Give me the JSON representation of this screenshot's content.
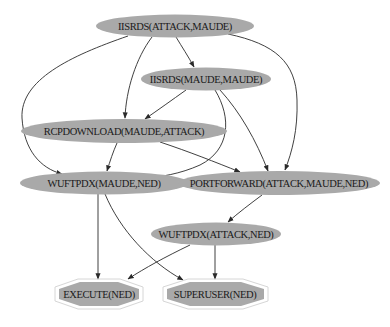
{
  "diagram": {
    "type": "attack-graph",
    "nodes": [
      {
        "id": "n1",
        "label": "IISRDS(ATTACK,MAUDE)",
        "shape": "ellipse"
      },
      {
        "id": "n2",
        "label": "IISRDS(MAUDE,MAUDE)",
        "shape": "ellipse"
      },
      {
        "id": "n3",
        "label": "RCPDOWNLOAD(MAUDE,ATTACK)",
        "shape": "ellipse"
      },
      {
        "id": "n4",
        "label": "WUFTPDX(MAUDE,NED)",
        "shape": "ellipse"
      },
      {
        "id": "n5",
        "label": "PORTFORWARD(ATTACK,MAUDE,NED)",
        "shape": "ellipse"
      },
      {
        "id": "n6",
        "label": "WUFTPDX(ATTACK,NED)",
        "shape": "ellipse"
      },
      {
        "id": "n7",
        "label": "EXECUTE(NED)",
        "shape": "double-octagon"
      },
      {
        "id": "n8",
        "label": "SUPERUSER(NED)",
        "shape": "double-octagon"
      }
    ],
    "edges": [
      {
        "from": "n1",
        "to": "n2"
      },
      {
        "from": "n1",
        "to": "n3"
      },
      {
        "from": "n1",
        "to": "n4"
      },
      {
        "from": "n1",
        "to": "n5"
      },
      {
        "from": "n2",
        "to": "n3"
      },
      {
        "from": "n2",
        "to": "n4"
      },
      {
        "from": "n2",
        "to": "n5"
      },
      {
        "from": "n3",
        "to": "n4"
      },
      {
        "from": "n3",
        "to": "n5"
      },
      {
        "from": "n4",
        "to": "n7"
      },
      {
        "from": "n4",
        "to": "n8"
      },
      {
        "from": "n5",
        "to": "n6"
      },
      {
        "from": "n6",
        "to": "n7"
      },
      {
        "from": "n6",
        "to": "n8"
      }
    ],
    "colors": {
      "node_fill": "#a9a9a9",
      "edge": "#2a2a2a",
      "goal_outline": "#d6d6d6",
      "background": "#ffffff"
    }
  }
}
